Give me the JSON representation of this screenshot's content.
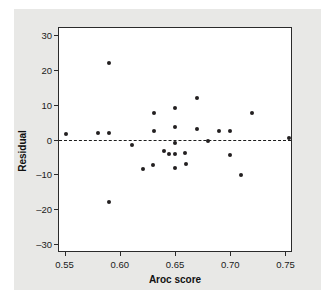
{
  "chart_data": {
    "type": "scatter",
    "title": "",
    "xlabel": "Aroc score",
    "ylabel": "Residual",
    "xlim": [
      0.545,
      0.755
    ],
    "ylim": [
      -32,
      32
    ],
    "xticks": [
      "0.55",
      "0.60",
      "0.65",
      "0.70",
      "0.75"
    ],
    "xtick_values": [
      0.55,
      0.6,
      0.65,
      0.7,
      0.75
    ],
    "yticks": [
      "30",
      "20",
      "10",
      "0",
      "–10",
      "–20",
      "–30"
    ],
    "ytick_values": [
      30,
      20,
      10,
      0,
      -10,
      -20,
      -30
    ],
    "grid": false,
    "legend": null,
    "reference_line": {
      "type": "horizontal",
      "y": 0,
      "style": "dashed",
      "color": "#1c1c1c"
    },
    "marker": {
      "shape": "circle",
      "color": "#231f20",
      "size": 4
    },
    "points": [
      {
        "x": 0.551,
        "y": 1.5
      },
      {
        "x": 0.58,
        "y": 1.8
      },
      {
        "x": 0.59,
        "y": 2.0
      },
      {
        "x": 0.59,
        "y": 22.0
      },
      {
        "x": 0.59,
        "y": -18.0
      },
      {
        "x": 0.611,
        "y": -1.6
      },
      {
        "x": 0.621,
        "y": -8.6
      },
      {
        "x": 0.63,
        "y": -7.4
      },
      {
        "x": 0.631,
        "y": 7.6
      },
      {
        "x": 0.631,
        "y": 2.4
      },
      {
        "x": 0.64,
        "y": -3.3
      },
      {
        "x": 0.645,
        "y": -4.3
      },
      {
        "x": 0.65,
        "y": 9.0
      },
      {
        "x": 0.65,
        "y": 3.7
      },
      {
        "x": 0.65,
        "y": -1.1
      },
      {
        "x": 0.65,
        "y": -4.3
      },
      {
        "x": 0.65,
        "y": -8.2
      },
      {
        "x": 0.659,
        "y": -3.9
      },
      {
        "x": 0.66,
        "y": -6.9
      },
      {
        "x": 0.67,
        "y": 12.0
      },
      {
        "x": 0.67,
        "y": 3.0
      },
      {
        "x": 0.68,
        "y": -0.5
      },
      {
        "x": 0.69,
        "y": 2.5
      },
      {
        "x": 0.7,
        "y": 2.5
      },
      {
        "x": 0.7,
        "y": -4.5
      },
      {
        "x": 0.71,
        "y": -10.2
      },
      {
        "x": 0.72,
        "y": 7.7
      },
      {
        "x": 0.753,
        "y": 0.3
      }
    ]
  }
}
